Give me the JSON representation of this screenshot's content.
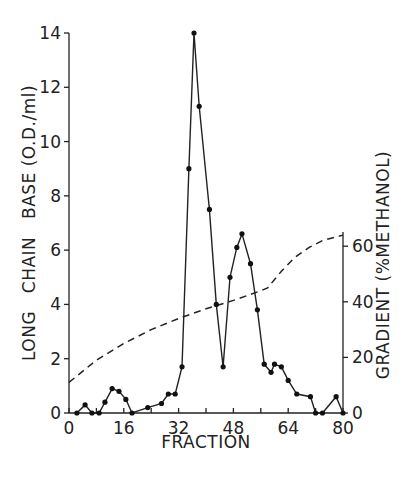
{
  "chart_data": {
    "type": "line",
    "title": "",
    "xlabel": "FRACTION",
    "ylabel": "LONG   CHAIN   BASE (O.D./ml)",
    "y2label": "GRADIENT (%METHANOL)",
    "xlim": [
      0,
      80
    ],
    "ylim": [
      0,
      14
    ],
    "y2lim": [
      0,
      70
    ],
    "xticks": [
      "0",
      "16",
      "32",
      "48",
      "64",
      "80"
    ],
    "yticks": [
      "0",
      "2",
      "4",
      "6",
      "8",
      "10",
      "12",
      "14"
    ],
    "y2ticks": [
      "0",
      "20",
      "40",
      "60"
    ],
    "grid": false,
    "series": [
      {
        "name": "Long chain base (O.D./ml)",
        "style": "solid-with-markers",
        "axis": "left",
        "x": [
          2.3,
          4.7,
          6.7,
          8.8,
          10.5,
          12.6,
          14.6,
          16.6,
          18.4,
          23,
          27,
          29,
          31,
          33,
          35,
          36.5,
          38,
          41,
          43,
          45,
          47,
          49,
          50.5,
          53,
          55,
          57,
          59,
          60,
          62,
          64,
          66.5,
          70.5,
          72,
          74,
          78,
          80
        ],
        "values": [
          0,
          0.3,
          0,
          0,
          0.4,
          0.9,
          0.8,
          0.5,
          0,
          0.2,
          0.35,
          0.7,
          0.7,
          1.7,
          9.0,
          14.0,
          11.3,
          7.5,
          4.0,
          1.7,
          5.0,
          6.1,
          6.6,
          5.5,
          3.8,
          1.8,
          1.5,
          1.8,
          1.7,
          1.2,
          0.7,
          0.6,
          0,
          0,
          0.6,
          0
        ]
      },
      {
        "name": "Gradient (% methanol)",
        "style": "dashed",
        "axis": "right",
        "x": [
          0,
          8,
          16,
          24,
          32,
          40,
          48,
          56,
          58,
          62,
          66,
          70,
          74,
          80
        ],
        "values": [
          11,
          19,
          25,
          30,
          34,
          37.5,
          40.5,
          44,
          45,
          51,
          56,
          59.5,
          62,
          64
        ]
      }
    ]
  }
}
